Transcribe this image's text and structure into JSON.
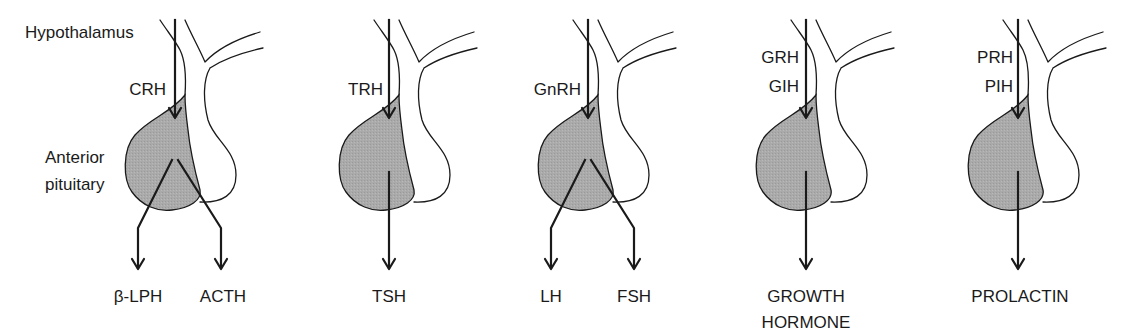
{
  "diagram": {
    "colors": {
      "ink": "#1a1a1a",
      "gland_fill": "#aaaaaa",
      "background": "#ffffff"
    },
    "labels": {
      "hypothalamus": "Hypothalamus",
      "anterior_line1": "Anterior",
      "anterior_line2": "pituitary"
    },
    "panels": [
      {
        "offset_x": 0,
        "releasing": [
          "CRH"
        ],
        "outputs": [
          "β-LPH",
          "ACTH"
        ],
        "branching": true
      },
      {
        "offset_x": 214,
        "releasing": [
          "TRH"
        ],
        "outputs": [
          "TSH"
        ],
        "branching": false
      },
      {
        "offset_x": 413,
        "releasing": [
          "GnRH"
        ],
        "outputs": [
          "LH",
          "FSH"
        ],
        "branching": true
      },
      {
        "offset_x": 631,
        "releasing": [
          "GRH",
          "GIH"
        ],
        "outputs": [
          "GROWTH",
          "HORMONE"
        ],
        "branching": false,
        "output_multiline": true
      },
      {
        "offset_x": 843,
        "releasing": [
          "PRH",
          "PIH"
        ],
        "outputs": [
          "PROLACTIN"
        ],
        "branching": false
      }
    ]
  }
}
